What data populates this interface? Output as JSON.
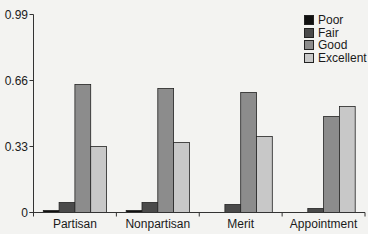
{
  "chart_data": {
    "type": "bar",
    "title": "",
    "xlabel": "",
    "ylabel": "",
    "ylim": [
      0,
      0.99
    ],
    "yticks": [
      0,
      0.33,
      0.66,
      0.99
    ],
    "ytick_labels": [
      "0",
      "0.33",
      "0.66",
      "0.99"
    ],
    "grid": false,
    "legend_position": "upper right",
    "categories": [
      "Partisan",
      "Nonpartisan",
      "Merit",
      "Appointment"
    ],
    "series": [
      {
        "name": "Poor",
        "color": "#111111",
        "values": [
          0.01,
          0.01,
          0.0,
          0.0
        ]
      },
      {
        "name": "Fair",
        "color": "#4a4a4a",
        "values": [
          0.05,
          0.05,
          0.04,
          0.02
        ]
      },
      {
        "name": "Good",
        "color": "#8c8c8c",
        "values": [
          0.64,
          0.62,
          0.6,
          0.48
        ]
      },
      {
        "name": "Excellent",
        "color": "#c8c8c8",
        "values": [
          0.33,
          0.35,
          0.38,
          0.53
        ]
      }
    ]
  }
}
